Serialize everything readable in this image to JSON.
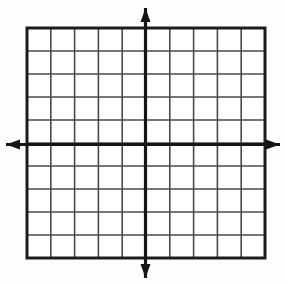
{
  "figure": {
    "name": "blank-cartesian-coordinate-grid",
    "title": "",
    "width": 286,
    "height": 284,
    "background_color": "#fefefe"
  },
  "chart_data": {
    "type": "scatter",
    "title": "",
    "subtitle": "",
    "xlabel": "",
    "ylabel": "",
    "series": [],
    "x": [],
    "values": [],
    "annotations": [],
    "legend": {
      "entries": [],
      "position": "none"
    },
    "grid": {
      "visible": true,
      "columns": 10,
      "rows": 10,
      "x_major_step": 1,
      "y_major_step": 1,
      "tick_labels_x": [],
      "tick_labels_y": [],
      "cell_width_px": 23.8,
      "cell_height_px": 23.0,
      "line_color": "#4a4a4a",
      "line_width_px": 1.6
    },
    "xlim": [
      -5,
      5
    ],
    "ylim": [
      -5,
      5
    ],
    "plot_area": {
      "left": 27,
      "top": 28,
      "right": 265,
      "bottom": 258,
      "border_color": "#1c1c1c",
      "border_width_px": 3
    },
    "axes": {
      "x_axis": {
        "name": "x-axis",
        "orientation": "horizontal",
        "y_px": 144.5,
        "from_px": 6,
        "to_px": 280,
        "color": "#151515",
        "line_width_px": 3.2,
        "arrow_start": true,
        "arrow_end": true
      },
      "y_axis": {
        "name": "y-axis",
        "orientation": "vertical",
        "x_px": 145.5,
        "from_px": 8,
        "to_px": 278,
        "color": "#151515",
        "line_width_px": 3.2,
        "arrow_start": true,
        "arrow_end": true
      },
      "origin_px": [
        145.5,
        144.5
      ]
    },
    "arrowheads": {
      "length_px": 14,
      "half_width_px": 5,
      "color": "#151515",
      "up": {
        "name": "y-axis-positive-arrowhead",
        "tip_px": [
          145.5,
          8
        ]
      },
      "down": {
        "name": "y-axis-negative-arrowhead",
        "tip_px": [
          145.5,
          278
        ]
      },
      "left": {
        "name": "x-axis-negative-arrowhead",
        "tip_px": [
          6,
          144.5
        ]
      },
      "right": {
        "name": "x-axis-positive-arrowhead",
        "tip_px": [
          280,
          144.5
        ]
      }
    },
    "colors": {
      "grid_line": "#4a4a4a",
      "grid_border": "#1c1c1c",
      "axis": "#151515",
      "background": "#fefefe",
      "cell_fill": "#ffffff"
    }
  }
}
